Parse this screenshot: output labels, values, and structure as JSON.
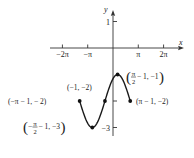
{
  "chart_data": {
    "type": "line",
    "title": "",
    "function": "y = sin(x + 1) - 2",
    "domain": [
      -4.14159,
      2.14159
    ],
    "xlabel": "x",
    "ylabel": "y",
    "grid": false,
    "x_ticks": [
      {
        "value": -6.28319,
        "label": "−2π"
      },
      {
        "value": -3.14159,
        "label": "−π"
      },
      {
        "value": 3.14159,
        "label": "π"
      },
      {
        "value": 6.28319,
        "label": "2π"
      }
    ],
    "y_ticks": [
      {
        "value": 1,
        "label": "1"
      },
      {
        "value": -2,
        "label": ""
      },
      {
        "value": -3,
        "label": "−3"
      }
    ],
    "xlim": [
      -8.3,
      8.6
    ],
    "ylim": [
      -3.3,
      1.4
    ],
    "points": [
      {
        "x": -4.14159,
        "y": -2,
        "label": "(−π − 1, − 2)"
      },
      {
        "x": -2.5708,
        "y": -3,
        "label_pre": "(−",
        "label_frac": "π",
        "label_den": "2",
        "label_post": " − 1, −3)"
      },
      {
        "x": -1,
        "y": -2,
        "label": "(−1, −2)"
      },
      {
        "x": 0.5708,
        "y": -1,
        "label_pre": "(",
        "label_frac": "π",
        "label_den": "2",
        "label_post": " − 1, −1)"
      },
      {
        "x": 2.14159,
        "y": -2,
        "label": "(π − 1, −2)"
      }
    ],
    "colors": {
      "curve": "#1a1a1a",
      "axis": "#333333",
      "text": "#222222"
    }
  }
}
